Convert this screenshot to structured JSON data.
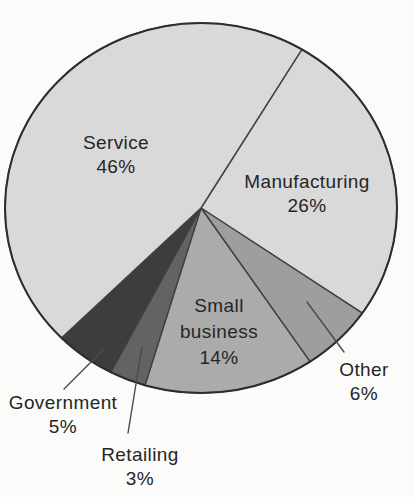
{
  "figure": {
    "background_color": "#fbfbfa",
    "outline_color": "#2e2e2e",
    "slice_stroke_color": "#414141",
    "leader_line_color": "#4a4a4a"
  },
  "chart_data": {
    "type": "pie",
    "title": "",
    "units": "percent",
    "direction": "clockwise",
    "start_angle_deg_cw_from_top": 31,
    "legend": "none",
    "label_style": "direct labels on large slices; leader lines to outside labels for Other, Government, Retailing",
    "categories": [
      "Manufacturing",
      "Other",
      "Small business",
      "Retailing",
      "Government",
      "Service"
    ],
    "values": [
      26,
      6,
      14,
      3,
      5,
      46
    ],
    "slices": [
      {
        "label": "Manufacturing",
        "value": 26,
        "pct_label": "26%",
        "color": "#d9d9d9"
      },
      {
        "label": "Other",
        "value": 6,
        "pct_label": "6%",
        "color": "#9e9e9e"
      },
      {
        "label": "Small business",
        "label_lines": [
          "Small",
          "business"
        ],
        "value": 14,
        "pct_label": "14%",
        "color": "#ababab"
      },
      {
        "label": "Retailing",
        "value": 3,
        "pct_label": "3%",
        "color": "#636363"
      },
      {
        "label": "Government",
        "value": 5,
        "pct_label": "5%",
        "color": "#3d3d3d"
      },
      {
        "label": "Service",
        "value": 46,
        "pct_label": "46%",
        "color": "#d9d9d9"
      }
    ]
  }
}
